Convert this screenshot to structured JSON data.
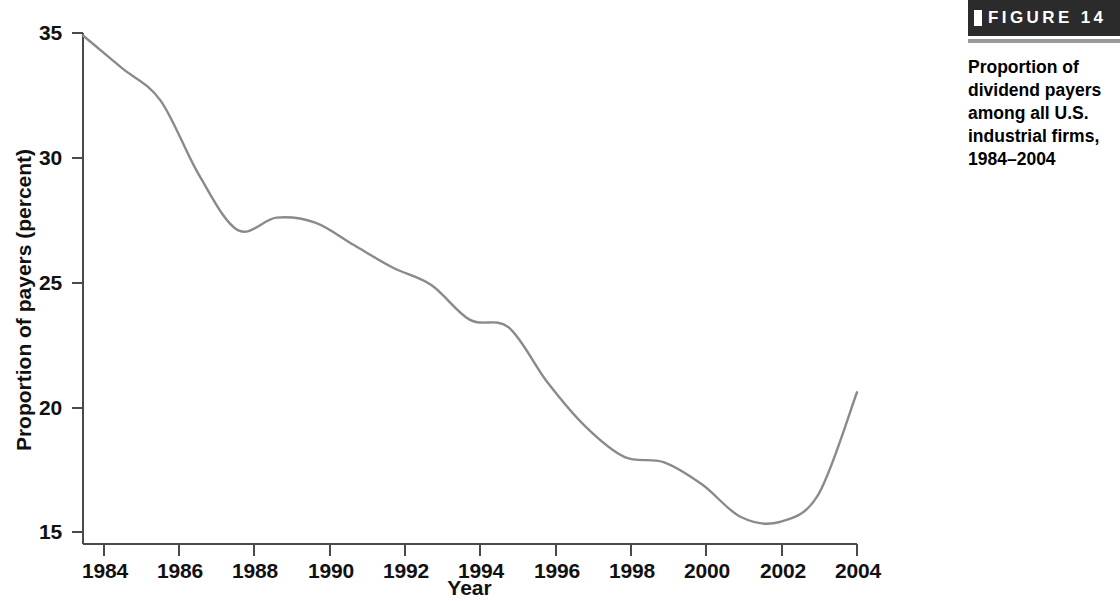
{
  "figure": {
    "banner_label": "FIGURE 14",
    "caption": "Proportion of dividend payers among all U.S. industrial firms, 1984–2004",
    "banner_bg": "#2b2b2b",
    "rule_color": "#9a9a9a"
  },
  "chart_data": {
    "type": "line",
    "title": "",
    "xlabel": "Year",
    "ylabel": "Proportion of payers (percent)",
    "xlim": [
      1984,
      2004
    ],
    "ylim": [
      15,
      35
    ],
    "xticks": [
      1984,
      1986,
      1988,
      1990,
      1992,
      1994,
      1996,
      1998,
      2000,
      2002,
      2004
    ],
    "yticks": [
      15,
      20,
      25,
      30,
      35
    ],
    "xtick_labels": [
      "1984",
      "1986",
      "1988",
      "1990",
      "1992",
      "1994",
      "1996",
      "1998",
      "2000",
      "2002",
      "2004"
    ],
    "ytick_labels": [
      "15",
      "20",
      "25",
      "30",
      "35"
    ],
    "grid": false,
    "legend": false,
    "line_color": "#8a8a8a",
    "axis_color": "#4a4a4a",
    "x": [
      1984,
      1985,
      1986,
      1987,
      1988,
      1989,
      1990,
      1991,
      1992,
      1993,
      1994,
      1995,
      1996,
      1997,
      1998,
      1999,
      2000,
      2001,
      2002,
      2003,
      2004
    ],
    "values": [
      34.9,
      33.6,
      32.3,
      29.3,
      27.1,
      27.6,
      27.4,
      26.5,
      25.6,
      24.9,
      23.5,
      23.2,
      21.0,
      19.2,
      18.0,
      17.8,
      16.9,
      15.6,
      15.4,
      16.5,
      20.6
    ],
    "series": [
      {
        "name": "Proportion of payers",
        "values": [
          34.9,
          33.6,
          32.3,
          29.3,
          27.1,
          27.6,
          27.4,
          26.5,
          25.6,
          24.9,
          23.5,
          23.2,
          21.0,
          19.2,
          18.0,
          17.8,
          16.9,
          15.6,
          15.4,
          16.5,
          20.6
        ]
      }
    ],
    "annotations": [
      {
        "label": "start value",
        "x": 1984,
        "y": 34.9
      },
      {
        "label": "local minimum (late 1980s)",
        "x": 1988,
        "y": 27.1
      },
      {
        "label": "local maximum",
        "x": 1989.5,
        "y": 27.6
      },
      {
        "label": "plateau",
        "x": 1994,
        "y": 23.5
      },
      {
        "label": "global minimum",
        "x": 2001.7,
        "y": 15.4
      },
      {
        "label": "end value",
        "x": 2004,
        "y": 20.6
      }
    ]
  }
}
